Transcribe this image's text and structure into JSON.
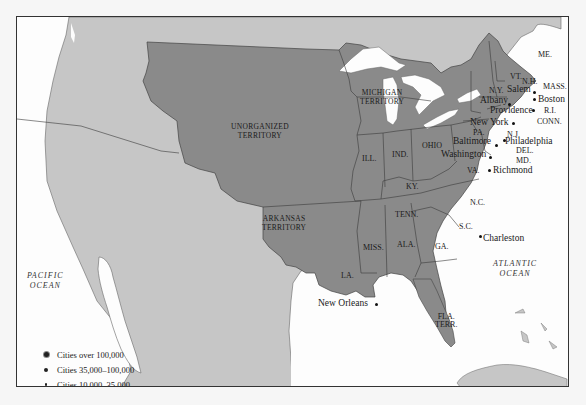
{
  "map": {
    "colors": {
      "water": "#fdfdfd",
      "foreign_land": "#c6c6c6",
      "us_territory": "#8a8a8a",
      "borders": "#3a3a3a",
      "background": "#f6f6f6"
    },
    "territories": [
      {
        "id": "unorganized",
        "label_lines": [
          "UNORGANIZED",
          "TERRITORY"
        ]
      },
      {
        "id": "michigan",
        "label_lines": [
          "MICHIGAN",
          "TERRITORY"
        ]
      },
      {
        "id": "arkansas",
        "label_lines": [
          "ARKANSAS",
          "TERRITORY"
        ]
      },
      {
        "id": "florida",
        "label_lines": [
          "FLA.",
          "TERR."
        ]
      }
    ],
    "states": {
      "me": "ME.",
      "vt": "VT.",
      "nh": "N.H.",
      "ny": "N.Y.",
      "mass": "MASS.",
      "ri": "R.I.",
      "conn": "CONN.",
      "pa": "PA.",
      "nj": "N.J.",
      "del": "DEL.",
      "md": "MD.",
      "va": "VA.",
      "ohio": "OHIO",
      "ind": "IND.",
      "ill": "ILL.",
      "ky": "KY.",
      "tenn": "TENN.",
      "nc": "N.C.",
      "sc": "S.C.",
      "ga": "GA.",
      "ala": "ALA.",
      "miss": "MISS.",
      "la": "LA."
    },
    "cities": {
      "salem": "Salem",
      "boston": "Boston",
      "albany": "Albany",
      "providence": "Providence",
      "new_york": "New York",
      "philadelphia": "Philadelphia",
      "baltimore": "Baltimore",
      "washington": "Washington",
      "richmond": "Richmond",
      "charleston": "Charleston",
      "new_orleans": "New Orleans"
    },
    "oceans": {
      "pacific": [
        "PACIFIC",
        "OCEAN"
      ],
      "atlantic": [
        "ATLANTIC",
        "OCEAN"
      ]
    },
    "legend": {
      "items": [
        {
          "symbol": "large-dot",
          "label": "Cities over 100,000"
        },
        {
          "symbol": "medium-dot",
          "label": "Cities 35,000–100,000"
        },
        {
          "symbol": "small-dot",
          "label": "Cities 10,000–35,000"
        }
      ]
    }
  }
}
